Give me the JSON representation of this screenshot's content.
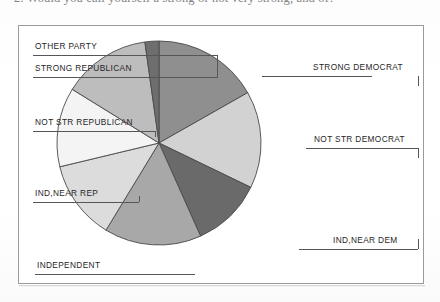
{
  "document": {
    "top_question_text": "2. Would you call yourself a strong or not very strong, and of?"
  },
  "chart_data": {
    "type": "pie",
    "title": "",
    "legend_position": "callout-labels",
    "categories": [
      "STRONG DEMOCRAT",
      "NOT STR DEMOCRAT",
      "IND,NEAR DEM",
      "INDEPENDENT",
      "IND,NEAR REP",
      "NOT STR REPUBLICAN",
      "STRONG REPUBLICAN",
      "OTHER PARTY"
    ],
    "values": [
      16.7,
      15.3,
      11.1,
      15.3,
      12.5,
      12.5,
      13.9,
      2.2
    ],
    "units": "percent",
    "colors": [
      "#8f8f8f",
      "#d2d2d2",
      "#6a6a6a",
      "#a8a8a8",
      "#dcdcdc",
      "#f4f4f4",
      "#bdbdbd",
      "#6e6e6e"
    ],
    "start_angle_deg": 0,
    "direction": "clockwise"
  },
  "labels": {
    "left": [
      {
        "text": "OTHER PARTY"
      },
      {
        "text": "STRONG REPUBLICAN"
      },
      {
        "text": "NOT STR REPUBLICAN"
      },
      {
        "text": "IND,NEAR REP"
      },
      {
        "text": "INDEPENDENT"
      }
    ],
    "right": [
      {
        "text": "STRONG DEMOCRAT"
      },
      {
        "text": "NOT STR DEMOCRAT"
      },
      {
        "text": "IND,NEAR DEM"
      }
    ]
  }
}
